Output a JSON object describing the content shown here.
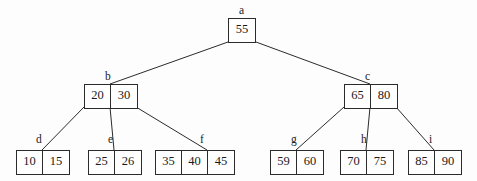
{
  "diagram": {
    "background_color": "#fdfdfd",
    "line_color": "#2b2b2b",
    "text_color": "#1a1a1a",
    "nodes": [
      {
        "id": "a",
        "label": "a",
        "keys": [
          "55"
        ],
        "x": 228,
        "y": 18,
        "label_x": 239,
        "label_y": 4
      },
      {
        "id": "b",
        "label": "b",
        "keys": [
          "20",
          "30"
        ],
        "x": 84,
        "y": 84,
        "label_x": 105,
        "label_y": 70
      },
      {
        "id": "c",
        "label": "c",
        "keys": [
          "65",
          "80"
        ],
        "x": 344,
        "y": 84,
        "label_x": 365,
        "label_y": 70
      },
      {
        "id": "d",
        "label": "d",
        "keys": [
          "10",
          "15"
        ],
        "x": 16,
        "y": 150,
        "label_x": 36,
        "label_y": 133
      },
      {
        "id": "e",
        "label": "e",
        "keys": [
          "25",
          "26"
        ],
        "x": 88,
        "y": 150,
        "label_x": 108,
        "label_y": 133
      },
      {
        "id": "f",
        "label": "f",
        "keys": [
          "35",
          "40",
          "45"
        ],
        "x": 155,
        "y": 150,
        "label_x": 200,
        "label_y": 133
      },
      {
        "id": "g",
        "label": "g",
        "keys": [
          "59",
          "60"
        ],
        "x": 270,
        "y": 150,
        "label_x": 291,
        "label_y": 133
      },
      {
        "id": "h",
        "label": "h",
        "keys": [
          "70",
          "75"
        ],
        "x": 340,
        "y": 150,
        "label_x": 361,
        "label_y": 133
      },
      {
        "id": "i",
        "label": "i",
        "keys": [
          "85",
          "90"
        ],
        "x": 408,
        "y": 150,
        "label_x": 429,
        "label_y": 133
      }
    ],
    "edges": [
      {
        "from": "a",
        "to": "b",
        "x1": 228,
        "y1": 42,
        "x2": 110,
        "y2": 84
      },
      {
        "from": "a",
        "to": "c",
        "x1": 256,
        "y1": 42,
        "x2": 370,
        "y2": 84
      },
      {
        "from": "b",
        "to": "d",
        "x1": 84,
        "y1": 107,
        "x2": 42,
        "y2": 150
      },
      {
        "from": "b",
        "to": "e",
        "x1": 110,
        "y1": 107,
        "x2": 114,
        "y2": 150
      },
      {
        "from": "b",
        "to": "f",
        "x1": 136,
        "y1": 107,
        "x2": 207,
        "y2": 150
      },
      {
        "from": "c",
        "to": "g",
        "x1": 344,
        "y1": 107,
        "x2": 296,
        "y2": 150
      },
      {
        "from": "c",
        "to": "h",
        "x1": 370,
        "y1": 107,
        "x2": 366,
        "y2": 150
      },
      {
        "from": "c",
        "to": "i",
        "x1": 396,
        "y1": 107,
        "x2": 434,
        "y2": 150
      }
    ]
  }
}
